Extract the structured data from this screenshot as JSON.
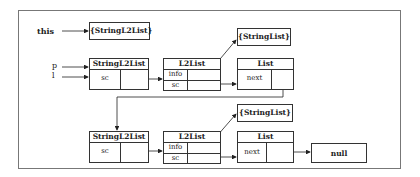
{
  "diagram": {
    "pointers": {
      "this": "this",
      "p": "p",
      "l": "l"
    },
    "this_target": "{StringL2List}",
    "top_row": {
      "wrapper": {
        "title": "StringL2List",
        "field": "sc"
      },
      "node": {
        "title": "L2List",
        "fields": [
          "info",
          "sc"
        ]
      },
      "info_target": "{StringList}",
      "list": {
        "title": "List",
        "field": "next"
      }
    },
    "bottom_row": {
      "wrapper": {
        "title": "StringL2List",
        "field": "sc"
      },
      "node": {
        "title": "L2List",
        "fields": [
          "info",
          "sc"
        ]
      },
      "info_target": "{StringList}",
      "list": {
        "title": "List",
        "field": "next"
      },
      "terminal": "null"
    }
  }
}
